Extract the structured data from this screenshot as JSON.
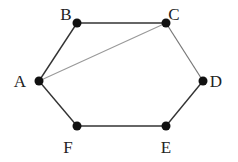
{
  "diagram": {
    "type": "graph",
    "nodes": [
      {
        "id": "A",
        "label": "A",
        "x": 39,
        "y": 81,
        "lx": 20,
        "ly": 87
      },
      {
        "id": "B",
        "label": "B",
        "x": 77,
        "y": 23,
        "lx": 66,
        "ly": 20
      },
      {
        "id": "C",
        "label": "C",
        "x": 166,
        "y": 23,
        "lx": 174,
        "ly": 20
      },
      {
        "id": "D",
        "label": "D",
        "x": 203,
        "y": 81,
        "lx": 216,
        "ly": 87
      },
      {
        "id": "E",
        "label": "E",
        "x": 166,
        "y": 126,
        "lx": 166,
        "ly": 153
      },
      {
        "id": "F",
        "label": "F",
        "x": 77,
        "y": 126,
        "lx": 68,
        "ly": 153
      }
    ],
    "edges": [
      {
        "from": "A",
        "to": "B",
        "color": "#333333",
        "width": 1.4
      },
      {
        "from": "B",
        "to": "C",
        "color": "#333333",
        "width": 1.4
      },
      {
        "from": "C",
        "to": "D",
        "color": "#777777",
        "width": 1.2
      },
      {
        "from": "D",
        "to": "E",
        "color": "#333333",
        "width": 1.4
      },
      {
        "from": "E",
        "to": "F",
        "color": "#333333",
        "width": 1.4
      },
      {
        "from": "F",
        "to": "A",
        "color": "#333333",
        "width": 1.4
      },
      {
        "from": "A",
        "to": "C",
        "color": "#999999",
        "width": 1.1
      }
    ],
    "node_color": "#111111",
    "node_radius": 4.5
  }
}
